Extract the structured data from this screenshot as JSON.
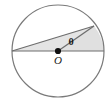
{
  "figure": {
    "type": "geometry-diagram",
    "width": 108,
    "height": 104,
    "background_color": "#ffffff"
  },
  "colors": {
    "stroke": "#7a7a7a",
    "chord_stroke": "#6e6e6e",
    "shade_fill": "#e4e4e4",
    "sector_fill": "#e0e0e0",
    "point_fill": "#111111",
    "label_color": "#1a1a1a"
  },
  "circle": {
    "center_x": 58,
    "center_y": 51,
    "radius": 46,
    "stroke_width": 1.2
  },
  "points": {
    "center": {
      "x": 58,
      "y": 51,
      "label": "O"
    },
    "left": {
      "x": 12,
      "y": 51,
      "label": ""
    },
    "right": {
      "x": 104,
      "y": 51,
      "label": ""
    },
    "upper": {
      "x": 94,
      "y": 26,
      "label": ""
    }
  },
  "angle": {
    "label": "θ",
    "label_x": 71,
    "label_y": 45,
    "vertex": "O",
    "degrees": 29
  },
  "segments": [
    {
      "name": "diameter",
      "from": "left",
      "to": "right"
    },
    {
      "name": "chord-left-to-upper",
      "from": "left",
      "to": "upper"
    },
    {
      "name": "radius-center-to-upper",
      "from": "center",
      "to": "upper"
    }
  ],
  "shaded_regions": [
    {
      "name": "triangle-region",
      "vertices": "left,center,upper"
    },
    {
      "name": "sector-region",
      "vertices": "center,upper,right-arc"
    }
  ]
}
